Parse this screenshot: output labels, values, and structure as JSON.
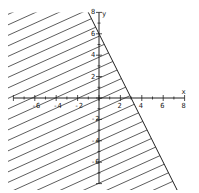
{
  "chart_data": {
    "type": "line",
    "title": "",
    "boundary_line": {
      "slope": -2,
      "intercept": 6,
      "style": "solid",
      "points": [
        [
          -1,
          8
        ],
        [
          7.3,
          -8.6
        ]
      ]
    },
    "shaded_region": "below-left of line (y <= -2x + 6)",
    "xlabel": "x",
    "ylabel": "y",
    "xlim": [
      -8,
      8
    ],
    "ylim": [
      -8,
      8
    ],
    "x_ticks": [
      -6,
      -4,
      -2,
      2,
      4,
      6,
      8
    ],
    "y_ticks": [
      -6,
      -4,
      -2,
      2,
      4,
      6,
      8
    ],
    "grid": false,
    "legend": null
  },
  "axes": {
    "x_label": "x",
    "y_label": "y"
  },
  "colors": {
    "line": "#222222",
    "hatch": "#333333",
    "background": "#ffffff"
  }
}
